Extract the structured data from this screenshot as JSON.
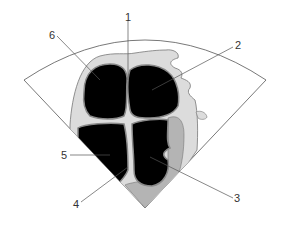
{
  "diagram": {
    "type": "echocardiogram-four-chamber-view",
    "colors": {
      "background": "#ffffff",
      "sector_outline": "#555555",
      "chambers": "#000000",
      "myocardium": "#dcdcdc",
      "wall_outline": "#777777",
      "gray_region": "#b4b4b4",
      "leader_line": "#555555"
    },
    "labels": [
      {
        "id": "1",
        "text": "1"
      },
      {
        "id": "2",
        "text": "2"
      },
      {
        "id": "3",
        "text": "3"
      },
      {
        "id": "4",
        "text": "4"
      },
      {
        "id": "5",
        "text": "5"
      },
      {
        "id": "6",
        "text": "6"
      }
    ]
  }
}
